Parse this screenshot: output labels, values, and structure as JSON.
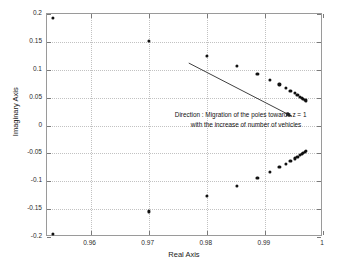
{
  "chart_data": {
    "type": "scatter",
    "title": "",
    "xlabel": "Real Axis",
    "ylabel": "Imaginary Axis",
    "xlim": [
      0.9525,
      1.0
    ],
    "ylim": [
      -0.2,
      0.2
    ],
    "xticks": [
      0.96,
      0.97,
      0.98,
      0.99,
      1
    ],
    "xtick_labels": [
      "0.96",
      "0.97",
      "0.98",
      "0.99",
      "1"
    ],
    "yticks": [
      -0.2,
      -0.15,
      -0.1,
      -0.05,
      0,
      0.05,
      0.1,
      0.15,
      0.2
    ],
    "ytick_labels": [
      "-0.2",
      "-0.15",
      "-0.1",
      "-0.05",
      "0",
      "0.05",
      "0.1",
      "0.15",
      "0.2"
    ],
    "grid": true,
    "legend": "none",
    "series": [
      {
        "name": "poles-upper",
        "marker": "filled-circle",
        "color": "#111111",
        "points": [
          [
            0.95355,
            0.193
          ],
          [
            0.97,
            0.1512
          ],
          [
            0.98,
            0.1245
          ],
          [
            0.9852,
            0.1062
          ],
          [
            0.9887,
            0.0928
          ],
          [
            0.9909,
            0.0818
          ],
          [
            0.9925,
            0.0738
          ],
          [
            0.9936,
            0.0672
          ],
          [
            0.9944,
            0.0622
          ],
          [
            0.9951,
            0.0578
          ],
          [
            0.9956,
            0.0546
          ],
          [
            0.996,
            0.0518
          ],
          [
            0.99635,
            0.0496
          ],
          [
            0.9966,
            0.0478
          ],
          [
            0.99685,
            0.0462
          ],
          [
            0.99705,
            0.045
          ]
        ]
      },
      {
        "name": "poles-lower",
        "marker": "filled-circle",
        "color": "#111111",
        "points": [
          [
            0.95355,
            -0.1945
          ],
          [
            0.97,
            -0.154
          ],
          [
            0.98,
            -0.126
          ],
          [
            0.9852,
            -0.1082
          ],
          [
            0.9887,
            -0.0938
          ],
          [
            0.9909,
            -0.0828
          ],
          [
            0.9925,
            -0.0748
          ],
          [
            0.9936,
            -0.0685
          ],
          [
            0.9944,
            -0.0632
          ],
          [
            0.9951,
            -0.059
          ],
          [
            0.9956,
            -0.0558
          ],
          [
            0.996,
            -0.053
          ],
          [
            0.99635,
            -0.0508
          ],
          [
            0.9966,
            -0.049
          ],
          [
            0.99685,
            -0.0472
          ],
          [
            0.99705,
            -0.046
          ]
        ]
      }
    ],
    "annotations": [
      {
        "name": "direction-note",
        "line1": "Direction : Migration of the poles towards z = 1",
        "line2": "with the increase of number of vehicles",
        "x": 0.9745,
        "y": 0.011
      }
    ],
    "arrow": {
      "name": "migration-arrow",
      "from": [
        0.9769,
        0.112
      ],
      "to": [
        0.99465,
        0.0165
      ],
      "color": "#2a2a2a"
    }
  }
}
